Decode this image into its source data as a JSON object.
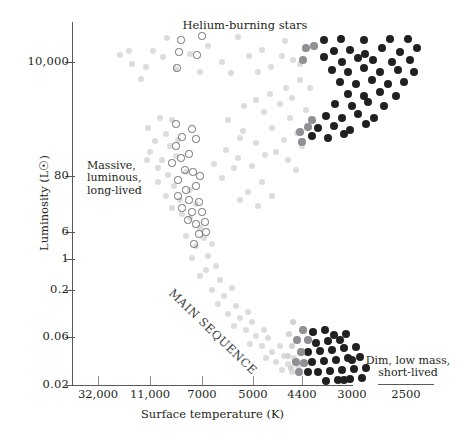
{
  "chart_data": {
    "type": "scatter",
    "title": "Helium-burning stars",
    "xlabel": "Surface temperature (K)",
    "ylabel": "Luminosity (L☉)",
    "grid": false,
    "legend_position": "none",
    "x_axis_inverted": true,
    "x_scale": "log-reversed",
    "y_scale": "log",
    "xticks": [
      {
        "label": "32,000",
        "px": 98
      },
      {
        "label": "11,000",
        "px": 150
      },
      {
        "label": "7000",
        "px": 202
      },
      {
        "label": "5000",
        "px": 253
      },
      {
        "label": "4400",
        "px": 302
      },
      {
        "label": "3000",
        "px": 352
      },
      {
        "label": "2500",
        "px": 406
      }
    ],
    "yticks": [
      {
        "label": "10,000",
        "px": 62
      },
      {
        "label": "80",
        "px": 176
      },
      {
        "label": "6",
        "px": 232
      },
      {
        "label": "1",
        "px": 259
      },
      {
        "label": "0.2",
        "px": 290
      },
      {
        "label": "0.06",
        "px": 337
      },
      {
        "label": "0.02",
        "px": 385
      }
    ],
    "annotations": [
      {
        "name": "massive-luminous",
        "text": "Massive,\nluminous,\nlong-lived"
      },
      {
        "name": "dim-low-mass",
        "text": "Dim, low mass,\nshort-lived"
      },
      {
        "name": "main-sequence",
        "text": "MAIN SEQUENCE"
      }
    ],
    "series": [
      {
        "name": "faint-background-stars",
        "style": "filled",
        "color": "#dcdcde",
        "radius": 3.2,
        "points": [
          [
            129,
            51
          ],
          [
            153,
            51
          ],
          [
            167,
            38
          ],
          [
            208,
            46
          ],
          [
            238,
            37
          ],
          [
            262,
            50
          ],
          [
            285,
            41
          ],
          [
            293,
            60
          ],
          [
            132,
            64
          ],
          [
            146,
            67
          ],
          [
            176,
            69
          ],
          [
            190,
            54
          ],
          [
            222,
            62
          ],
          [
            249,
            56
          ],
          [
            271,
            67
          ],
          [
            300,
            64
          ],
          [
            141,
            79
          ],
          [
            163,
            57
          ],
          [
            200,
            72
          ],
          [
            231,
            73
          ],
          [
            258,
            72
          ],
          [
            282,
            56
          ],
          [
            305,
            49
          ],
          [
            120,
            55
          ],
          [
            148,
            128
          ],
          [
            160,
            118
          ],
          [
            166,
            134
          ],
          [
            155,
            141
          ],
          [
            170,
            146
          ],
          [
            150,
            152
          ],
          [
            162,
            160
          ],
          [
            172,
            120
          ],
          [
            178,
            140
          ],
          [
            158,
            168
          ],
          [
            168,
            175
          ],
          [
            176,
            156
          ],
          [
            147,
            160
          ],
          [
            174,
            186
          ],
          [
            166,
            196
          ],
          [
            180,
            200
          ],
          [
            186,
            172
          ],
          [
            190,
            190
          ],
          [
            158,
            182
          ],
          [
            182,
            214
          ],
          [
            172,
            208
          ],
          [
            190,
            218
          ],
          [
            196,
            204
          ],
          [
            200,
            228
          ],
          [
            186,
            236
          ],
          [
            196,
            246
          ],
          [
            204,
            238
          ],
          [
            192,
            258
          ],
          [
            208,
            256
          ],
          [
            212,
            244
          ],
          [
            206,
            270
          ],
          [
            216,
            266
          ],
          [
            200,
            276
          ],
          [
            220,
            280
          ],
          [
            212,
            290
          ],
          [
            224,
            296
          ],
          [
            232,
            288
          ],
          [
            218,
            304
          ],
          [
            236,
            306
          ],
          [
            228,
            314
          ],
          [
            240,
            318
          ],
          [
            248,
            312
          ],
          [
            234,
            326
          ],
          [
            246,
            330
          ],
          [
            252,
            322
          ],
          [
            256,
            336
          ],
          [
            264,
            330
          ],
          [
            250,
            344
          ],
          [
            262,
            346
          ],
          [
            268,
            338
          ],
          [
            272,
            352
          ],
          [
            280,
            346
          ],
          [
            266,
            358
          ],
          [
            276,
            362
          ],
          [
            284,
            356
          ],
          [
            288,
            364
          ],
          [
            294,
            358
          ],
          [
            282,
            370
          ],
          [
            292,
            372
          ],
          [
            298,
            366
          ],
          [
            228,
            120
          ],
          [
            243,
            131
          ],
          [
            256,
            143
          ],
          [
            265,
            155
          ],
          [
            252,
            166
          ],
          [
            238,
            158
          ],
          [
            272,
            128
          ],
          [
            284,
            140
          ],
          [
            276,
            152
          ],
          [
            290,
            118
          ],
          [
            297,
            133
          ],
          [
            288,
            160
          ],
          [
            262,
            182
          ],
          [
            248,
            192
          ],
          [
            272,
            196
          ],
          [
            258,
            206
          ],
          [
            240,
            200
          ],
          [
            222,
            178
          ],
          [
            234,
            168
          ],
          [
            214,
            164
          ],
          [
            226,
            150
          ],
          [
            240,
            138
          ],
          [
            302,
            146
          ],
          [
            296,
            170
          ],
          [
            306,
            110
          ],
          [
            292,
            98
          ],
          [
            280,
            104
          ],
          [
            264,
            112
          ],
          [
            310,
            88
          ],
          [
            300,
            80
          ],
          [
            286,
            88
          ],
          [
            270,
            94
          ],
          [
            256,
            100
          ],
          [
            244,
            106
          ]
        ]
      },
      {
        "name": "open-circle-stars",
        "style": "open",
        "color": "#6d6e71",
        "radius": 3.6,
        "points": [
          [
            181,
            40
          ],
          [
            202,
            36
          ],
          [
            179,
            52
          ],
          [
            197,
            55
          ],
          [
            177,
            68
          ],
          [
            176,
            124
          ],
          [
            192,
            129
          ],
          [
            182,
            137
          ],
          [
            196,
            139
          ],
          [
            176,
            146
          ],
          [
            181,
            158
          ],
          [
            189,
            154
          ],
          [
            172,
            163
          ],
          [
            185,
            170
          ],
          [
            178,
            180
          ],
          [
            193,
            172
          ],
          [
            186,
            190
          ],
          [
            196,
            186
          ],
          [
            200,
            176
          ],
          [
            189,
            200
          ],
          [
            199,
            202
          ],
          [
            178,
            196
          ],
          [
            192,
            212
          ],
          [
            202,
            212
          ],
          [
            182,
            208
          ],
          [
            196,
            224
          ],
          [
            205,
            222
          ],
          [
            188,
            220
          ],
          [
            199,
            234
          ],
          [
            194,
            244
          ],
          [
            206,
            232
          ]
        ]
      },
      {
        "name": "giant-branch-stars",
        "style": "filled",
        "color": "#221f1f",
        "radius": 4.0,
        "points": [
          [
            324,
            40
          ],
          [
            341,
            39
          ],
          [
            364,
            40
          ],
          [
            390,
            39
          ],
          [
            408,
            39
          ],
          [
            334,
            51
          ],
          [
            350,
            50
          ],
          [
            365,
            54
          ],
          [
            382,
            48
          ],
          [
            400,
            52
          ],
          [
            417,
            48
          ],
          [
            324,
            57
          ],
          [
            342,
            62
          ],
          [
            358,
            58
          ],
          [
            373,
            60
          ],
          [
            392,
            62
          ],
          [
            410,
            60
          ],
          [
            332,
            70
          ],
          [
            348,
            72
          ],
          [
            364,
            68
          ],
          [
            380,
            72
          ],
          [
            398,
            70
          ],
          [
            414,
            72
          ],
          [
            340,
            82
          ],
          [
            356,
            84
          ],
          [
            372,
            80
          ],
          [
            388,
            84
          ],
          [
            404,
            82
          ],
          [
            348,
            94
          ],
          [
            364,
            96
          ],
          [
            380,
            92
          ],
          [
            396,
            96
          ],
          [
            335,
            104
          ],
          [
            352,
            106
          ],
          [
            368,
            102
          ],
          [
            384,
            106
          ],
          [
            326,
            116
          ],
          [
            342,
            118
          ],
          [
            358,
            114
          ],
          [
            374,
            118
          ],
          [
            318,
            128
          ],
          [
            334,
            126
          ],
          [
            350,
            130
          ],
          [
            366,
            124
          ],
          [
            312,
            136
          ],
          [
            328,
            138
          ],
          [
            344,
            134
          ]
        ]
      },
      {
        "name": "giant-branch-mid-gray",
        "style": "filled",
        "color": "#8e9094",
        "radius": 3.8,
        "points": [
          [
            306,
            48
          ],
          [
            314,
            46
          ],
          [
            303,
            60
          ],
          [
            308,
            127
          ],
          [
            300,
            132
          ],
          [
            312,
            120
          ],
          [
            302,
            142
          ]
        ]
      },
      {
        "name": "red-dwarf-stars",
        "style": "filled",
        "color": "#221f1f",
        "radius": 4.0,
        "points": [
          [
            313,
            332
          ],
          [
            325,
            330
          ],
          [
            316,
            343
          ],
          [
            328,
            341
          ],
          [
            340,
            340
          ],
          [
            308,
            352
          ],
          [
            320,
            351
          ],
          [
            332,
            350
          ],
          [
            344,
            348
          ],
          [
            356,
            347
          ],
          [
            312,
            362
          ],
          [
            324,
            361
          ],
          [
            336,
            360
          ],
          [
            348,
            358
          ],
          [
            360,
            357
          ],
          [
            318,
            372
          ],
          [
            330,
            371
          ],
          [
            342,
            370
          ],
          [
            354,
            369
          ],
          [
            366,
            368
          ],
          [
            326,
            381
          ],
          [
            338,
            380
          ],
          [
            350,
            379
          ],
          [
            362,
            378
          ],
          [
            334,
            335
          ],
          [
            346,
            334
          ],
          [
            352,
            360
          ],
          [
            344,
            380
          ],
          [
            308,
            372
          ]
        ]
      },
      {
        "name": "red-dwarf-mid-gray",
        "style": "filled",
        "color": "#8e9094",
        "radius": 3.8,
        "points": [
          [
            303,
            330
          ],
          [
            297,
            340
          ],
          [
            301,
            352
          ],
          [
            296,
            362
          ],
          [
            304,
            363
          ],
          [
            299,
            372
          ],
          [
            308,
            340
          ]
        ]
      },
      {
        "name": "red-dwarf-light-gray",
        "style": "filled",
        "color": "#d2d3d5",
        "radius": 3.4,
        "points": [
          [
            293,
            322
          ],
          [
            289,
            334
          ],
          [
            292,
            346
          ],
          [
            288,
            356
          ],
          [
            291,
            368
          ]
        ]
      }
    ]
  },
  "chart": {
    "title": "Helium-burning stars",
    "xlabel": "Surface temperature (K)",
    "ylabel": "Luminosity (L☉)",
    "annot_massive": "Massive,\nluminous,\nlong-lived",
    "annot_dim": "Dim, low mass,\nshort-lived",
    "main_sequence_label": "MAIN SEQUENCE"
  },
  "colors": {
    "axis": "#58595b",
    "tick": "#8a8a8d",
    "text": "#231f20",
    "dark_star": "#221f1f",
    "mid_star": "#8e9094",
    "faint_star": "#dcdcde",
    "open_star": "#6d6e71",
    "background": "#ffffff"
  }
}
